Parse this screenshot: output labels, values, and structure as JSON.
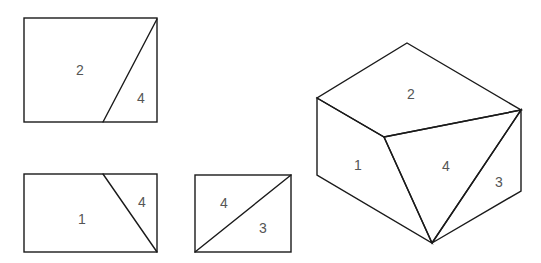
{
  "diagram": {
    "title": "",
    "views": [
      {
        "name": "top-view",
        "rect": [
          24,
          18,
          157,
          122
        ],
        "line": [
          157,
          19,
          103,
          122
        ],
        "labels": [
          {
            "text": "2",
            "x": 80,
            "y": 71
          },
          {
            "text": "4",
            "x": 141,
            "y": 99
          }
        ]
      },
      {
        "name": "front-view",
        "rect": [
          24,
          174,
          157,
          252
        ],
        "line": [
          103,
          174,
          157,
          252
        ],
        "labels": [
          {
            "text": "1",
            "x": 82,
            "y": 220
          },
          {
            "text": "4",
            "x": 142,
            "y": 203
          }
        ]
      },
      {
        "name": "side-view",
        "rect": [
          195,
          175,
          291,
          252
        ],
        "line": [
          195,
          252,
          291,
          175
        ],
        "labels": [
          {
            "text": "4",
            "x": 224,
            "y": 204
          },
          {
            "text": "3",
            "x": 263,
            "y": 229
          }
        ]
      }
    ],
    "isometric": {
      "name": "isometric-view",
      "vertices": {
        "top": [
          407,
          43
        ],
        "left_top": [
          317,
          98
        ],
        "front_mid": [
          384,
          137
        ],
        "right_top": [
          521,
          110
        ],
        "left_bottom": [
          317,
          175
        ],
        "bottom": [
          432,
          243
        ],
        "right_bottom": [
          521,
          191
        ]
      },
      "labels": [
        {
          "text": "2",
          "x": 411,
          "y": 95
        },
        {
          "text": "1",
          "x": 358,
          "y": 166
        },
        {
          "text": "4",
          "x": 446,
          "y": 167
        },
        {
          "text": "3",
          "x": 499,
          "y": 183
        }
      ]
    },
    "colors": {
      "line": "#1a1a1a",
      "label": "#555555",
      "background": "#ffffff"
    }
  }
}
